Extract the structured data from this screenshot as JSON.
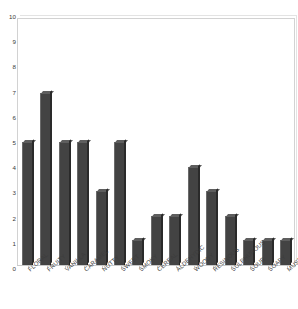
{
  "chart_data": {
    "type": "bar",
    "title": "",
    "subtitle": "",
    "xlabel": "",
    "ylabel": "",
    "ylim": [
      0,
      10
    ],
    "ytick_labels": [
      "0",
      "1",
      "2",
      "3",
      "4",
      "5",
      "6",
      "7",
      "8",
      "9",
      "10"
    ],
    "ytick_values": [
      0,
      1,
      2,
      3,
      4,
      5,
      6,
      7,
      8,
      9,
      10
    ],
    "grid": false,
    "legend": false,
    "legend_position": "none",
    "bar_color": "#434343",
    "background_color": "#ffffff",
    "frame_color": "#d2d2d2",
    "categories": [
      "FLORAL",
      "FRUITY",
      "VANILLA",
      "CARAMEL",
      "NUTTY",
      "SWEET",
      "SMOKY",
      "CEREAL",
      "ALDEHYDIC",
      "WOODY",
      "RESINOUS",
      "SULPHUROUS",
      "SOUR",
      "SOAPY",
      "MUSTY"
    ],
    "values": [
      5,
      7,
      5,
      5,
      3,
      5,
      1,
      2,
      2,
      4,
      3,
      2,
      1,
      1,
      1
    ]
  }
}
